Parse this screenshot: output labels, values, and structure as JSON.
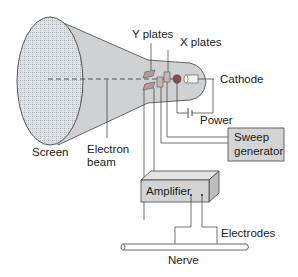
{
  "diagram": {
    "labels": {
      "y_plates": "Y plates",
      "x_plates": "X plates",
      "cathode": "Cathode",
      "power": "Power",
      "screen": "Screen",
      "electron_beam_line1": "Electron",
      "electron_beam_line2": "beam",
      "sweep_line1": "Sweep",
      "sweep_line2": "generator",
      "amplifier": "Amplifier",
      "electrodes": "Electrodes",
      "nerve": "Nerve"
    },
    "components": [
      {
        "id": "screen",
        "label": "Screen"
      },
      {
        "id": "crt-tube",
        "label": ""
      },
      {
        "id": "y-plates",
        "label": "Y plates"
      },
      {
        "id": "x-plates",
        "label": "X plates"
      },
      {
        "id": "cathode",
        "label": "Cathode"
      },
      {
        "id": "power",
        "label": "Power"
      },
      {
        "id": "sweep-generator",
        "label": "Sweep generator"
      },
      {
        "id": "amplifier",
        "label": "Amplifier"
      },
      {
        "id": "electrodes",
        "label": "Electrodes"
      },
      {
        "id": "nerve",
        "label": "Nerve"
      }
    ],
    "connections": [
      {
        "from": "y-plates",
        "to": "amplifier"
      },
      {
        "from": "x-plates",
        "to": "sweep-generator"
      },
      {
        "from": "cathode",
        "to": "power"
      },
      {
        "from": "amplifier",
        "to": "electrodes"
      },
      {
        "from": "electrodes",
        "to": "nerve"
      }
    ],
    "colors": {
      "tube_fill": "#cfd1d2",
      "screen_fill": "#dcdedf",
      "plate_fill": "#b89a98",
      "grid_box_fill": "#d4d4d4",
      "grid_fill": "#8fa0a8",
      "line": "#333333"
    }
  }
}
